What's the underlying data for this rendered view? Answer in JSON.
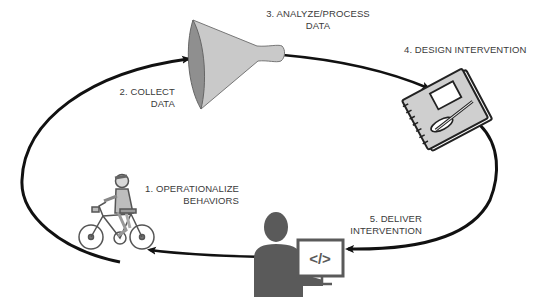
{
  "diagram": {
    "type": "cycle",
    "colors": {
      "arrow": "#111111",
      "text": "#3a3a3a",
      "icon_fill": "#c8c8c8",
      "icon_dark": "#555555",
      "person": "#5a5a5a"
    },
    "steps": [
      {
        "number": 1,
        "line1": "1. OPERATIONALIZE",
        "line2": "BEHAVIORS",
        "icon": "person-on-bicycle-icon"
      },
      {
        "number": 2,
        "line1": "2. COLLECT",
        "line2": "DATA",
        "icon": "funnel-icon"
      },
      {
        "number": 3,
        "line1": "3. ANALYZE/PROCESS",
        "line2": "DATA",
        "icon": "funnel-icon"
      },
      {
        "number": 4,
        "line1": "4. DESIGN INTERVENTION",
        "line2": "",
        "icon": "notebook-sketch-icon"
      },
      {
        "number": 5,
        "line1": "5. DELIVER",
        "line2": "INTERVENTION",
        "icon": "person-at-computer-code-icon"
      }
    ],
    "code_glyph": "</>"
  }
}
